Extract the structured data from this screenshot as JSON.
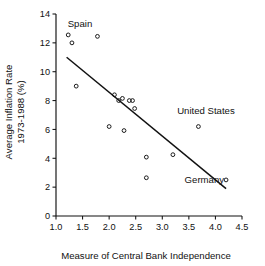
{
  "chart_data": {
    "type": "scatter",
    "title": "",
    "xlabel": "Measure of Central Bank Independence",
    "ylabel_line1": "Average Inflation Rate",
    "ylabel_line2": "1973-1988 (%)",
    "xlim": [
      1.0,
      4.5
    ],
    "ylim": [
      0,
      14
    ],
    "xticks": [
      "1.0",
      "1.5",
      "2.0",
      "2.5",
      "3.0",
      "3.5",
      "4.0",
      "4.5"
    ],
    "xtick_values": [
      1.0,
      1.5,
      2.0,
      2.5,
      3.0,
      3.5,
      4.0,
      4.5
    ],
    "yticks": [
      "0",
      "2",
      "4",
      "6",
      "8",
      "10",
      "12",
      "14"
    ],
    "ytick_values": [
      0,
      2,
      4,
      6,
      8,
      10,
      12,
      14
    ],
    "grid": false,
    "legend": "none",
    "marker": "open-circle",
    "points": [
      {
        "x": 1.23,
        "y": 12.55,
        "label": "Spain"
      },
      {
        "x": 1.3,
        "y": 12.0,
        "label": ""
      },
      {
        "x": 1.78,
        "y": 12.45,
        "label": ""
      },
      {
        "x": 1.38,
        "y": 9.0,
        "label": ""
      },
      {
        "x": 2.1,
        "y": 8.4,
        "label": ""
      },
      {
        "x": 2.18,
        "y": 8.0,
        "label": ""
      },
      {
        "x": 2.25,
        "y": 8.15,
        "label": ""
      },
      {
        "x": 2.38,
        "y": 8.0,
        "label": ""
      },
      {
        "x": 2.44,
        "y": 8.0,
        "label": ""
      },
      {
        "x": 2.48,
        "y": 7.45,
        "label": ""
      },
      {
        "x": 2.0,
        "y": 6.2,
        "label": ""
      },
      {
        "x": 2.28,
        "y": 5.92,
        "label": ""
      },
      {
        "x": 2.7,
        "y": 4.08,
        "label": ""
      },
      {
        "x": 3.2,
        "y": 4.25,
        "label": ""
      },
      {
        "x": 2.7,
        "y": 2.65,
        "label": ""
      },
      {
        "x": 3.68,
        "y": 6.2,
        "label": "United States"
      },
      {
        "x": 4.2,
        "y": 2.5,
        "label": "Germany"
      }
    ],
    "trend_line": {
      "x0": 1.2,
      "y0": 11.0,
      "x1": 4.2,
      "y1": 1.9
    },
    "annotations": [
      {
        "text": "Spain",
        "x": 1.22,
        "y": 13.1,
        "anchor": "start"
      },
      {
        "text": "United States",
        "x": 3.28,
        "y": 7.05,
        "anchor": "start"
      },
      {
        "text": "Germany",
        "x": 3.42,
        "y": 2.3,
        "anchor": "start"
      }
    ]
  },
  "colors": {
    "ink": "#111111",
    "background": "#ffffff"
  }
}
